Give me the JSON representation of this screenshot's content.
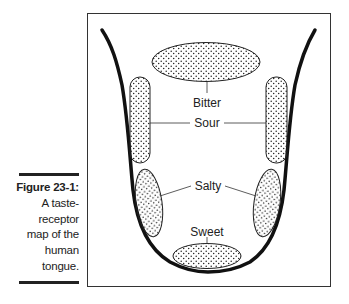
{
  "caption": {
    "figure_label": "Figure 23-1:",
    "lines": [
      "A taste-",
      "receptor",
      "map of the",
      "human",
      "tongue."
    ]
  },
  "diagram": {
    "regions": {
      "bitter": "Bitter",
      "sour": "Sour",
      "salty": "Salty",
      "sweet": "Sweet"
    },
    "colors": {
      "outline": "#111111",
      "frame": "#333333",
      "dots": "#222222",
      "background": "#ffffff"
    }
  }
}
